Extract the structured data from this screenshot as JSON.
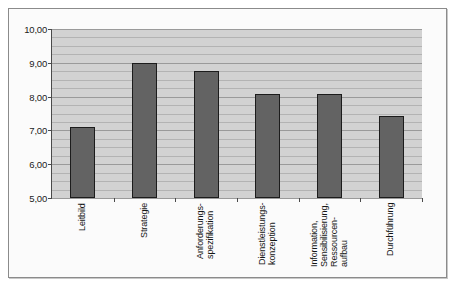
{
  "chart_data": {
    "type": "bar",
    "title": "",
    "subtitle": "",
    "xlabel": "",
    "ylabel": "",
    "ylim": [
      5.0,
      10.0
    ],
    "grid": true,
    "grid_major_step": 1.0,
    "grid_minor_step": 0.25,
    "legend": false,
    "legend_position": "none",
    "decimal_separator": ",",
    "categories": [
      "Leitbild",
      "Strategie",
      "Anforderungs-spezifikation",
      "Dienstleistungs-konzeption",
      "Information, Sensibilisierung, Ressourcen-aufbau",
      "Durchführung"
    ],
    "category_lines": [
      [
        "Leitbild"
      ],
      [
        "Strategie"
      ],
      [
        "Anforderungs-",
        "spezifikation"
      ],
      [
        "Dienstleistungs-",
        "konzeption"
      ],
      [
        "Information,",
        "Sensibilisierung,",
        "Ressourcen-",
        "aufbau"
      ],
      [
        "Durchführung"
      ]
    ],
    "values": [
      7.1,
      9.0,
      8.77,
      8.08,
      8.08,
      7.42
    ],
    "ytick_labels": [
      "10,00",
      "9,00",
      "8,00",
      "7,00",
      "6,00",
      "5,00"
    ],
    "ytick_values": [
      10.0,
      9.0,
      8.0,
      7.0,
      6.0,
      5.0
    ],
    "colors": {
      "bar_fill": "#636363",
      "bar_stroke": "#1c1c1c",
      "plot_background": "#d2d2d2",
      "gridline": "#9a9a9a",
      "axis": "#4a4a4a",
      "frame": "#8b8b8b",
      "page_background": "#fbfbfb",
      "text": "#151515"
    }
  }
}
